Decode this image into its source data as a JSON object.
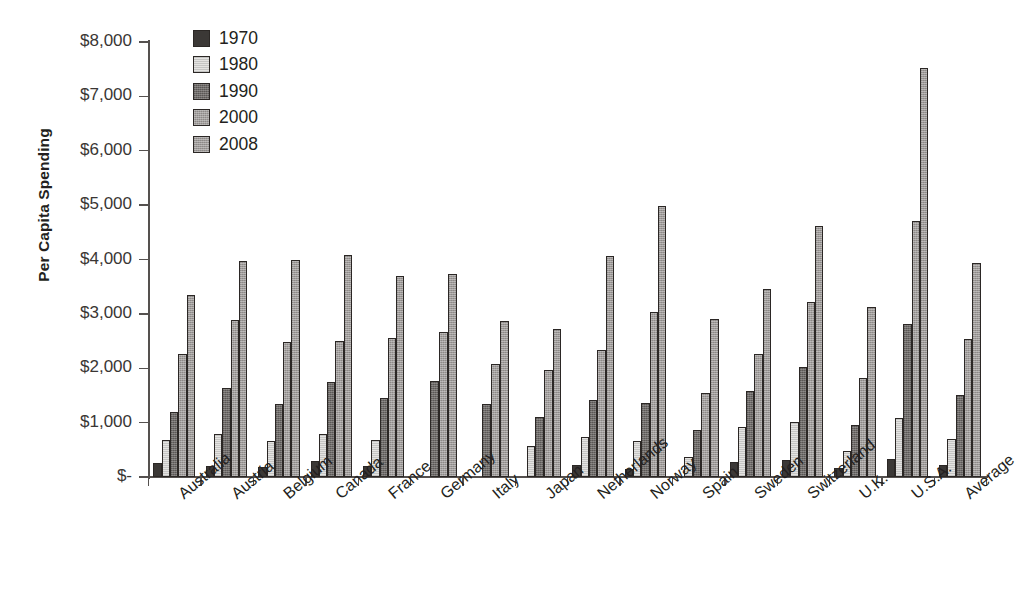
{
  "chart_data": {
    "type": "bar",
    "title": "",
    "subtitle": "",
    "xlabel": "",
    "ylabel": "Per Capita Spending",
    "ylim": [
      0,
      8000
    ],
    "ytick_step": 1000,
    "grid": false,
    "legend_position": "inside-top-left",
    "orientation": "vertical",
    "grouping": "clustered",
    "y_tick_labels": [
      "$8,000",
      "$7,000",
      "$6,000",
      "$5,000",
      "$4,000",
      "$3,000",
      "$2,000",
      "$1,000",
      "$-"
    ],
    "y_tick_values": [
      8000,
      7000,
      6000,
      5000,
      4000,
      3000,
      2000,
      1000,
      0
    ],
    "categories": [
      "Australia",
      "Austria",
      "Belgium",
      "Canada",
      "France",
      "Germany",
      "Italy",
      "Japan",
      "Netherlands",
      "Norway",
      "Spain",
      "Sweden",
      "Switzerland",
      "U.K.",
      "U.S.A.",
      "Average"
    ],
    "series": [
      {
        "name": "1970",
        "color": "#3b3836",
        "values": [
          250,
          210,
          180,
          290,
          200,
          null,
          null,
          null,
          230,
          140,
          null,
          270,
          320,
          160,
          330,
          230
        ]
      },
      {
        "name": "1980",
        "color": "#e4e3e1",
        "values": [
          680,
          790,
          660,
          800,
          680,
          null,
          null,
          570,
          730,
          660,
          370,
          920,
          1020,
          470,
          1090,
          700
        ]
      },
      {
        "name": "1990",
        "color": "#6e6a68",
        "values": [
          1200,
          1640,
          1350,
          1740,
          1450,
          1760,
          1340,
          1110,
          1410,
          1360,
          870,
          1580,
          2030,
          960,
          2810,
          1500
        ]
      },
      {
        "name": "2000",
        "color": "#8d8987",
        "values": [
          2270,
          2880,
          2490,
          2510,
          2550,
          2670,
          2070,
          1970,
          2330,
          3040,
          1540,
          2270,
          3220,
          1830,
          4700,
          2530
        ]
      },
      {
        "name": "2008",
        "color": "#9c9896",
        "values": [
          3350,
          3970,
          4000,
          4080,
          3700,
          3740,
          2870,
          2720,
          4060,
          4990,
          2900,
          3450,
          4620,
          3130,
          7520,
          3930
        ]
      }
    ]
  },
  "legend": {
    "entries": [
      {
        "label": "1970"
      },
      {
        "label": "1980"
      },
      {
        "label": "1990"
      },
      {
        "label": "2000"
      },
      {
        "label": "2008"
      }
    ]
  },
  "axes": {
    "y_title": "Per Capita Spending"
  }
}
